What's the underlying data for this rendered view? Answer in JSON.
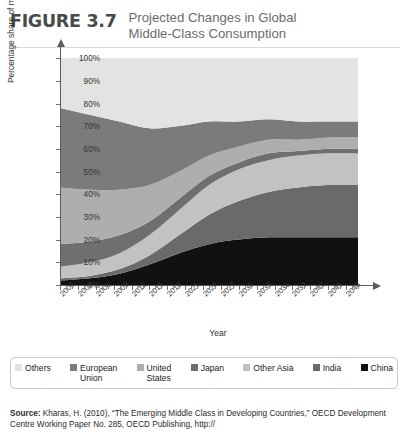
{
  "header": {
    "figure_number": "FIGURE 3.7",
    "title_line1": "Projected Changes in Global",
    "title_line2": "Middle-Class Consumption"
  },
  "axis": {
    "ylabel": "Percentage share of middle-class consumption",
    "xlabel": "Year"
  },
  "legend": {
    "items": [
      {
        "label": "Others",
        "color": "#e3e3e1"
      },
      {
        "label": "European\nUnion",
        "color": "#7b7b7b"
      },
      {
        "label": "United\nStates",
        "color": "#aeaeae"
      },
      {
        "label": "Japan",
        "color": "#6f6f6f"
      },
      {
        "label": "Other Asia",
        "color": "#c2c2c2"
      },
      {
        "label": "India",
        "color": "#6a6a6a"
      },
      {
        "label": "China",
        "color": "#111111"
      }
    ]
  },
  "source": {
    "label": "Source:",
    "text": " Kharas, H. (2010), “The Emerging Middle Class in Developing Countries,” OECD Development Centre Working Paper No. 285, OECD Publishing, http://"
  },
  "chart_data": {
    "type": "area",
    "title": "Projected Changes in Global Middle-Class Consumption",
    "xlabel": "Year",
    "ylabel": "Percentage share of middle-class consumption",
    "stacked": true,
    "stack_percent": true,
    "grid": false,
    "legend_position": "bottom",
    "xlim": [
      2000,
      2050
    ],
    "ylim": [
      0,
      100
    ],
    "ytick_labels": [
      "0%",
      "10%",
      "20%",
      "30%",
      "40%",
      "50%",
      "60%",
      "70%",
      "80%",
      "90%",
      "100%"
    ],
    "ytick_values": [
      0,
      10,
      20,
      30,
      40,
      50,
      60,
      70,
      80,
      90,
      100
    ],
    "xtick_labels": [
      "2000",
      "2003",
      "2006",
      "2009",
      "2012",
      "2015",
      "2018",
      "2021",
      "2024",
      "2027",
      "2030",
      "2033",
      "2036",
      "2039",
      "2042",
      "2045",
      "2048"
    ],
    "xtick_values": [
      2000,
      2003,
      2006,
      2009,
      2012,
      2015,
      2018,
      2021,
      2024,
      2027,
      2030,
      2033,
      2036,
      2039,
      2042,
      2045,
      2048
    ],
    "x": [
      2000,
      2005,
      2010,
      2015,
      2020,
      2025,
      2030,
      2035,
      2040,
      2045,
      2050
    ],
    "stack_order_bottom_to_top": [
      "China",
      "India",
      "Other Asia",
      "Japan",
      "United States",
      "European Union",
      "Others"
    ],
    "series": [
      {
        "name": "China",
        "color": "#111111",
        "values": [
          2,
          3,
          5,
          9,
          14,
          18,
          20,
          21,
          21,
          21,
          21
        ]
      },
      {
        "name": "India",
        "color": "#6a6a6a",
        "values": [
          1,
          1,
          2,
          4,
          8,
          13,
          17,
          20,
          22,
          23,
          23
        ]
      },
      {
        "name": "Other Asia",
        "color": "#c2c2c2",
        "values": [
          5,
          6,
          7,
          9,
          11,
          13,
          14,
          14,
          14,
          14,
          14
        ]
      },
      {
        "name": "Japan",
        "color": "#6f6f6f",
        "values": [
          10,
          9,
          8,
          6,
          5,
          4,
          3,
          3,
          2,
          2,
          2
        ]
      },
      {
        "name": "United States",
        "color": "#aeaeae",
        "values": [
          25,
          23,
          20,
          16,
          12,
          9,
          7,
          6,
          5,
          5,
          5
        ]
      },
      {
        "name": "European Union",
        "color": "#7b7b7b",
        "values": [
          35,
          33,
          30,
          25,
          20,
          15,
          11,
          9,
          8,
          7,
          7
        ]
      },
      {
        "name": "Others",
        "color": "#e3e3e1",
        "values": [
          22,
          25,
          28,
          31,
          30,
          28,
          28,
          27,
          28,
          28,
          28
        ]
      }
    ]
  }
}
